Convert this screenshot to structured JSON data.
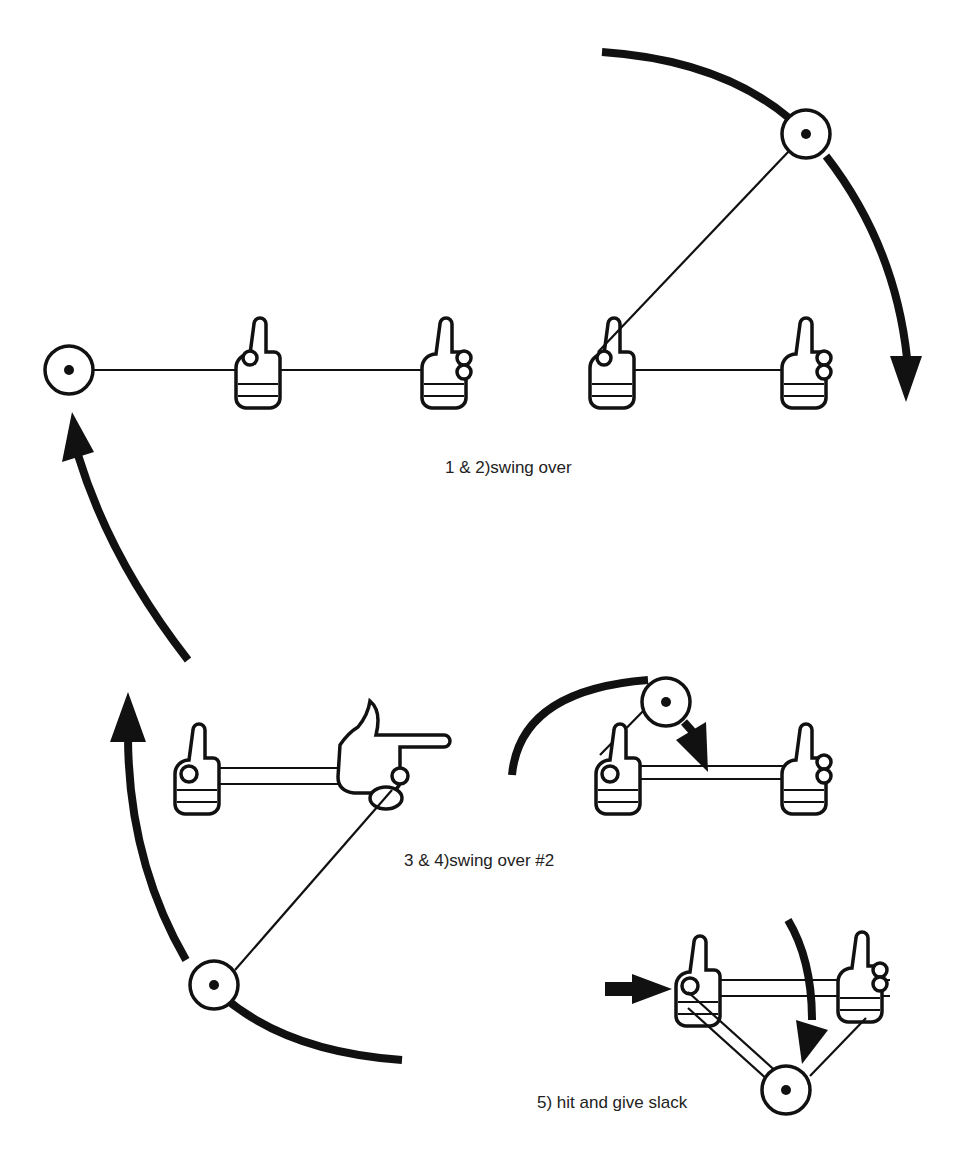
{
  "diagram": {
    "colors": {
      "ink": "#111111",
      "background": "#ffffff",
      "caption": "#222222"
    },
    "steps": [
      {
        "id": "step-1-2",
        "caption": "1 & 2)swing over"
      },
      {
        "id": "step-3-4",
        "caption": "3 & 4)swing over #2"
      },
      {
        "id": "step-5",
        "caption": "5) hit and give slack"
      }
    ],
    "icons": {
      "ball": "ball-circle-with-center-dot",
      "hand": "thumbs-up-hand-gripping-rope",
      "pointing_hand": "pointing-hand",
      "arrow": "curved-motion-arrow"
    }
  }
}
